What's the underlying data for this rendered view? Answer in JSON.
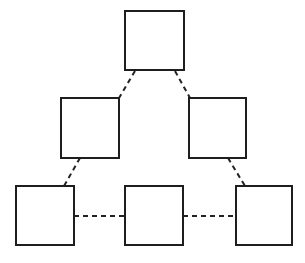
{
  "diagram": {
    "title": "",
    "width": 305,
    "height": 263,
    "colors": {
      "background": "#ffffff",
      "node_fill": "#ffffff",
      "node_stroke": "#1e1e1e",
      "edge_stroke": "#222222"
    },
    "nodes": [
      {
        "id": "top",
        "label": "",
        "x": 125,
        "y": 11,
        "w": 59,
        "h": 59
      },
      {
        "id": "mid-left",
        "label": "",
        "x": 61,
        "y": 98,
        "w": 58,
        "h": 60
      },
      {
        "id": "mid-right",
        "label": "",
        "x": 189,
        "y": 98,
        "w": 57,
        "h": 60
      },
      {
        "id": "bottom-left",
        "label": "",
        "x": 16,
        "y": 186,
        "w": 58,
        "h": 59
      },
      {
        "id": "bottom-middle",
        "label": "",
        "x": 125,
        "y": 186,
        "w": 58,
        "h": 59
      },
      {
        "id": "bottom-right",
        "label": "",
        "x": 236,
        "y": 186,
        "w": 56,
        "h": 59
      }
    ],
    "edges": [
      {
        "from": "top",
        "to": "mid-left",
        "style": "dashed",
        "x1": 135,
        "y1": 71,
        "x2": 119,
        "y2": 98
      },
      {
        "from": "top",
        "to": "mid-right",
        "style": "dashed",
        "x1": 175,
        "y1": 71,
        "x2": 190,
        "y2": 98
      },
      {
        "from": "mid-left",
        "to": "bottom-left",
        "style": "dashed",
        "x1": 80,
        "y1": 158,
        "x2": 64,
        "y2": 186
      },
      {
        "from": "mid-right",
        "to": "bottom-right",
        "style": "dashed",
        "x1": 228,
        "y1": 158,
        "x2": 245,
        "y2": 186
      },
      {
        "from": "bottom-left",
        "to": "bottom-middle",
        "style": "dashed",
        "x1": 74,
        "y1": 216,
        "x2": 125,
        "y2": 216
      },
      {
        "from": "bottom-middle",
        "to": "bottom-right",
        "style": "dashed",
        "x1": 183,
        "y1": 216,
        "x2": 236,
        "y2": 216
      }
    ]
  }
}
